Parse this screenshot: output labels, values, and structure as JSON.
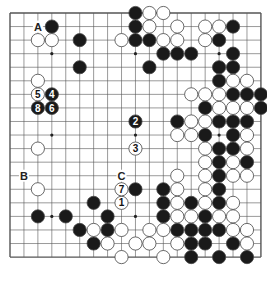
{
  "board": {
    "size": 19,
    "origin_x": 10,
    "origin_y": 13,
    "spacing_x": 13.94,
    "spacing_y": 13.56,
    "stone_radius": 6.6,
    "colors": {
      "line": "#555555",
      "black": "#1a1a1a",
      "white": "#ffffff",
      "stone_outline": "#444444",
      "background": "#ffffff"
    },
    "star_points": [
      [
        3,
        3
      ],
      [
        9,
        3
      ],
      [
        15,
        3
      ],
      [
        3,
        9
      ],
      [
        9,
        9
      ],
      [
        15,
        9
      ],
      [
        3,
        15
      ],
      [
        9,
        15
      ],
      [
        15,
        15
      ]
    ],
    "black_stones": [
      [
        9,
        0
      ],
      [
        9,
        1
      ],
      [
        9,
        2
      ],
      [
        10,
        2
      ],
      [
        11,
        3
      ],
      [
        12,
        3
      ],
      [
        13,
        3
      ],
      [
        10,
        4
      ],
      [
        3,
        1
      ],
      [
        5,
        2
      ],
      [
        5,
        4
      ],
      [
        16,
        1
      ],
      [
        15,
        2
      ],
      [
        16,
        3
      ],
      [
        15,
        4
      ],
      [
        16,
        4
      ],
      [
        15,
        5
      ],
      [
        16,
        6
      ],
      [
        17,
        6
      ],
      [
        18,
        6
      ],
      [
        14,
        7
      ],
      [
        18,
        7
      ],
      [
        12,
        8
      ],
      [
        15,
        8
      ],
      [
        16,
        8
      ],
      [
        17,
        8
      ],
      [
        14,
        9
      ],
      [
        16,
        9
      ],
      [
        15,
        10
      ],
      [
        16,
        10
      ],
      [
        15,
        11
      ],
      [
        17,
        11
      ],
      [
        15,
        12
      ],
      [
        15,
        13
      ],
      [
        15,
        14
      ],
      [
        13,
        14
      ],
      [
        11,
        14
      ],
      [
        11,
        15
      ],
      [
        14,
        15
      ],
      [
        12,
        16
      ],
      [
        13,
        16
      ],
      [
        14,
        16
      ],
      [
        15,
        16
      ],
      [
        13,
        17
      ],
      [
        14,
        17
      ],
      [
        16,
        17
      ],
      [
        13,
        18
      ],
      [
        15,
        18
      ],
      [
        17,
        18
      ],
      [
        9,
        13
      ],
      [
        11,
        13
      ],
      [
        6,
        14
      ],
      [
        2,
        15
      ],
      [
        4,
        15
      ],
      [
        7,
        15
      ],
      [
        5,
        16
      ],
      [
        7,
        16
      ],
      [
        6,
        17
      ]
    ],
    "white_stones": [
      [
        10,
        0
      ],
      [
        11,
        0
      ],
      [
        10,
        1
      ],
      [
        12,
        1
      ],
      [
        8,
        2
      ],
      [
        11,
        2
      ],
      [
        12,
        2
      ],
      [
        2,
        2
      ],
      [
        3,
        2
      ],
      [
        14,
        1
      ],
      [
        15,
        1
      ],
      [
        14,
        2
      ],
      [
        16,
        5
      ],
      [
        17,
        5
      ],
      [
        13,
        6
      ],
      [
        14,
        6
      ],
      [
        15,
        6
      ],
      [
        15,
        7
      ],
      [
        16,
        7
      ],
      [
        17,
        7
      ],
      [
        13,
        8
      ],
      [
        14,
        8
      ],
      [
        12,
        9
      ],
      [
        13,
        9
      ],
      [
        17,
        9
      ],
      [
        14,
        10
      ],
      [
        17,
        10
      ],
      [
        14,
        11
      ],
      [
        16,
        11
      ],
      [
        14,
        12
      ],
      [
        16,
        12
      ],
      [
        17,
        12
      ],
      [
        12,
        12
      ],
      [
        12,
        13
      ],
      [
        14,
        13
      ],
      [
        14,
        14
      ],
      [
        16,
        14
      ],
      [
        12,
        14
      ],
      [
        12,
        15
      ],
      [
        13,
        15
      ],
      [
        15,
        15
      ],
      [
        16,
        15
      ],
      [
        8,
        16
      ],
      [
        10,
        16
      ],
      [
        11,
        16
      ],
      [
        16,
        16
      ],
      [
        17,
        16
      ],
      [
        9,
        17
      ],
      [
        10,
        17
      ],
      [
        12,
        17
      ],
      [
        17,
        17
      ],
      [
        8,
        18
      ],
      [
        11,
        18
      ],
      [
        2,
        5
      ],
      [
        2,
        10
      ],
      [
        2,
        13
      ],
      [
        6,
        16
      ],
      [
        7,
        17
      ]
    ],
    "numbered_moves": [
      {
        "n": "1",
        "color": "white",
        "pos": [
          8,
          14
        ]
      },
      {
        "n": "2",
        "color": "black",
        "pos": [
          9,
          8
        ]
      },
      {
        "n": "3",
        "color": "white",
        "pos": [
          9,
          10
        ]
      },
      {
        "n": "4",
        "color": "black",
        "pos": [
          3,
          6
        ]
      },
      {
        "n": "5",
        "color": "white",
        "pos": [
          2,
          6
        ]
      },
      {
        "n": "6",
        "color": "black",
        "pos": [
          3,
          7
        ]
      },
      {
        "n": "7",
        "color": "white",
        "pos": [
          8,
          13
        ]
      },
      {
        "n": "8",
        "color": "black",
        "pos": [
          2,
          7
        ]
      }
    ],
    "letter_labels": [
      {
        "text": "A",
        "pos": [
          2,
          1
        ]
      },
      {
        "text": "B",
        "pos": [
          1,
          12
        ]
      },
      {
        "text": "C",
        "pos": [
          8,
          12
        ]
      }
    ]
  }
}
